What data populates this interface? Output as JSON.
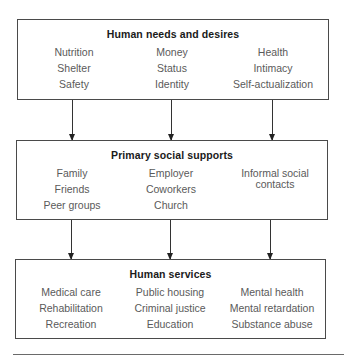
{
  "diagram": {
    "boxes": [
      {
        "title": "Human needs and desires",
        "columns": [
          [
            "Nutrition",
            "Shelter",
            "Safety"
          ],
          [
            "Money",
            "Status",
            "Identity"
          ],
          [
            "Health",
            "Intimacy",
            "Self-actualization"
          ]
        ]
      },
      {
        "title": "Primary social supports",
        "columns": [
          [
            "Family",
            "Friends",
            "Peer groups"
          ],
          [
            "Employer",
            "Coworkers",
            "Church"
          ],
          [
            "Informal social contacts"
          ]
        ]
      },
      {
        "title": "Human services",
        "columns": [
          [
            "Medical care",
            "Rehabilitation",
            "Recreation"
          ],
          [
            "Public housing",
            "Criminal justice",
            "Education"
          ],
          [
            "Mental health",
            "Mental retardation",
            "Substance abuse"
          ]
        ]
      }
    ],
    "connections": [
      {
        "from": "Human needs and desires",
        "to": "Primary social supports",
        "count": 3
      },
      {
        "from": "Primary social supports",
        "to": "Human services",
        "count": 3
      }
    ]
  }
}
